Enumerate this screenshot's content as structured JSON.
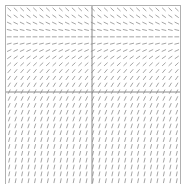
{
  "chart_data": {
    "type": "slope_field",
    "title": "",
    "xlabel": "",
    "ylabel": "",
    "xlim": [
      -3,
      3
    ],
    "ylim": [
      -3,
      3
    ],
    "grid_columns": 27,
    "grid_rows": 27,
    "equilibrium_y": 2.0,
    "slope_function": "dy/dx = 2 - y",
    "axes": {
      "x_axis_at_y": 0,
      "y_axis_at_x": 0
    },
    "colors": {
      "segment": "#9a9a9a",
      "axis": "#8a8a8a",
      "frame": "#b0b0b0",
      "background": "#ffffff"
    }
  }
}
